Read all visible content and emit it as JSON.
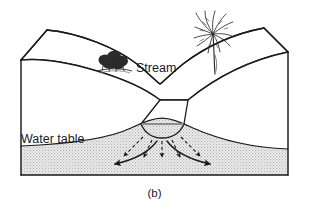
{
  "figure": {
    "caption": "(b)",
    "type": "block-diagram"
  },
  "labels": {
    "stream": "Stream",
    "water_table": "Water table"
  },
  "colors": {
    "outline": "#1a1a1a",
    "saturated_zone_fill": "#e8e8e8",
    "stipple_dot": "#a8a8a8",
    "stream_water_line": "#8c8c8c",
    "vegetation": "#2b2b2b",
    "background": "#ffffff"
  },
  "features": {
    "shrub_label": "shrub-cluster",
    "palm_label": "palm-tree",
    "seepage_arrow_count": 5,
    "lateral_flow_arrow_count": 2,
    "seepage_arrow_style": "dashed",
    "lateral_flow_arrow_style": "solid-curved"
  }
}
